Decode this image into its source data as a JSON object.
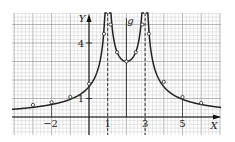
{
  "chart_data": {
    "type": "line",
    "title": "",
    "function_label": "g",
    "xlabel": "X",
    "ylabel": "Y",
    "x_tick_labels": [
      "−2",
      "1",
      "3",
      "5"
    ],
    "x_tick_values": [
      -2,
      1,
      3,
      5
    ],
    "y_tick_labels": [
      "1",
      "4"
    ],
    "y_tick_values": [
      1,
      4
    ],
    "xlim": [
      -4,
      7
    ],
    "ylim": [
      -1,
      5.5
    ],
    "grid": true,
    "grid_minor_step": 0.2,
    "vertical_asymptotes": [
      1,
      3
    ],
    "axis_of_symmetry": 2,
    "series": [
      {
        "name": "g (left branch)",
        "x": [
          -3,
          -2,
          -1,
          0,
          0.8
        ],
        "y": [
          0.65,
          0.8,
          1.08,
          1.8,
          4.5
        ]
      },
      {
        "name": "g (middle branch)",
        "x": [
          1.15,
          1.5,
          2,
          2.5,
          2.85
        ],
        "y": [
          5,
          3.5,
          3,
          3.5,
          5
        ]
      },
      {
        "name": "g (right branch)",
        "x": [
          3.2,
          4,
          5,
          6
        ],
        "y": [
          4.5,
          1.9,
          1.08,
          0.76
        ]
      }
    ],
    "marked_points": [
      [
        -3,
        0.65
      ],
      [
        -2,
        0.8
      ],
      [
        -1,
        1.08
      ],
      [
        0,
        1.8
      ],
      [
        0.8,
        4.5
      ],
      [
        1.15,
        5
      ],
      [
        1.5,
        3.5
      ],
      [
        2,
        3
      ],
      [
        2.5,
        3.5
      ],
      [
        2.85,
        5
      ],
      [
        3.2,
        4.5
      ],
      [
        4,
        1.9
      ],
      [
        5,
        1.08
      ],
      [
        6,
        0.76
      ]
    ]
  },
  "colors": {
    "grid_minor": "#c8c8c8",
    "grid_major": "#9a9a9a",
    "curve": "#222222",
    "axis": "#111111",
    "background": "#ffffff"
  }
}
